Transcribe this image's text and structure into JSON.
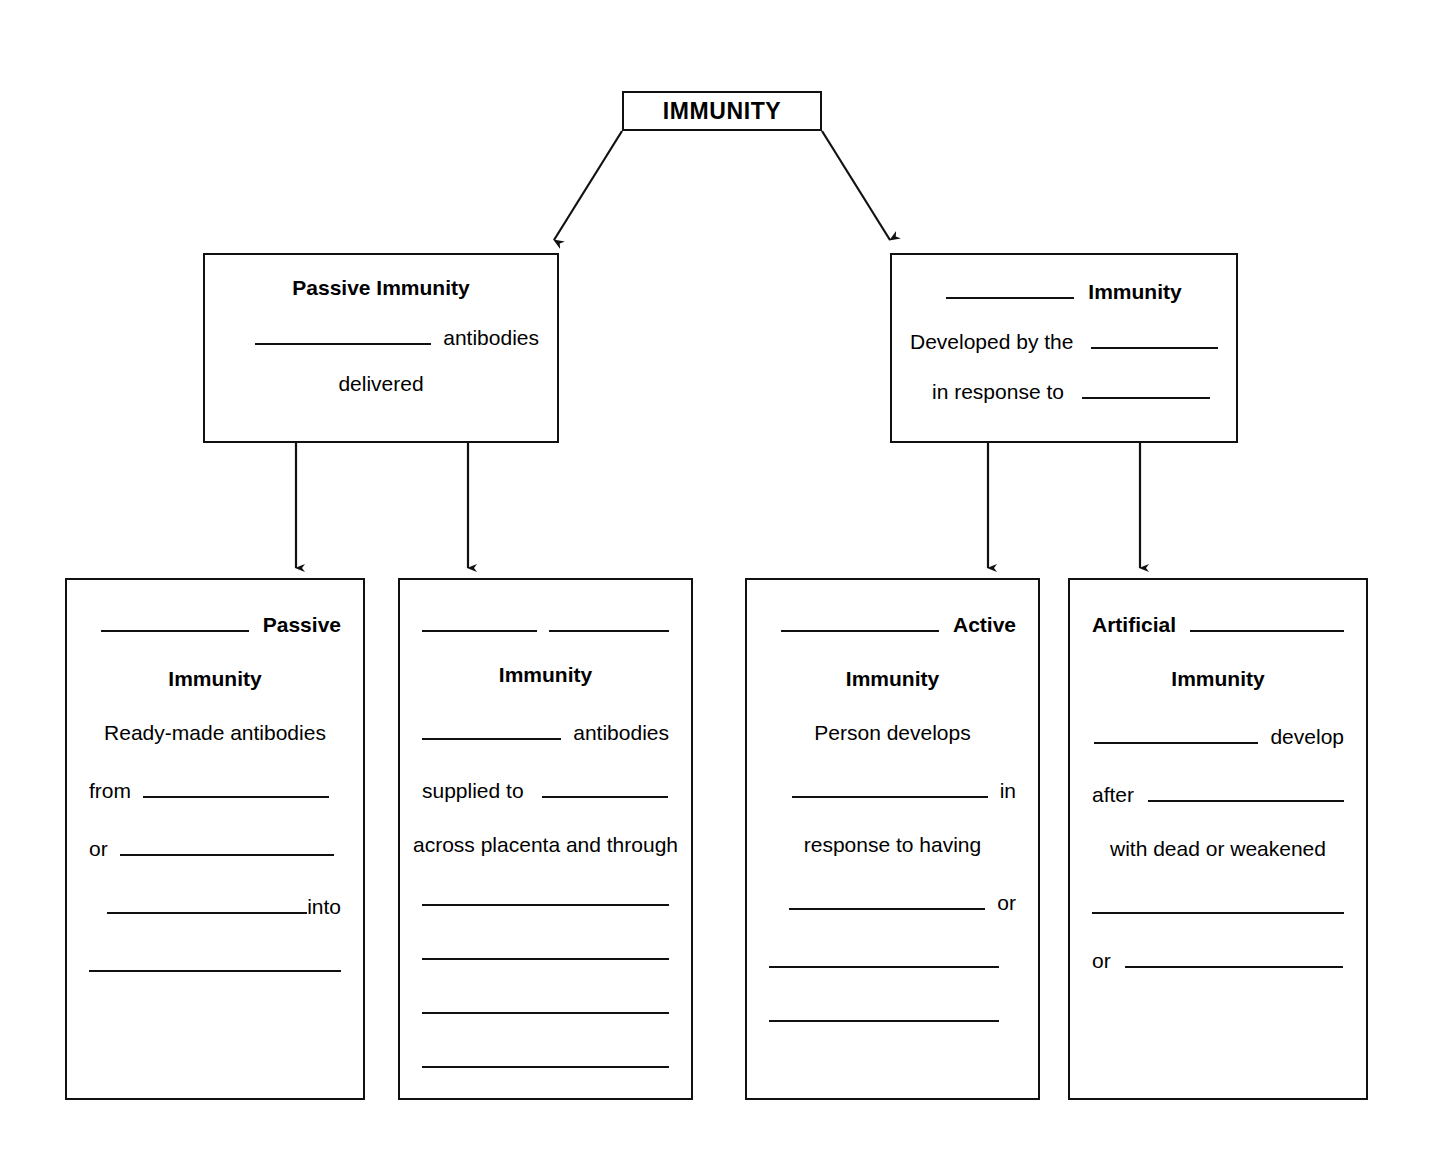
{
  "diagram": {
    "title": "IMMUNITY",
    "root": {
      "label": "IMMUNITY"
    },
    "level2": [
      {
        "id": "passive-immunity",
        "heading_text": "Passive Immunity",
        "heading_blank": false,
        "rows": [
          {
            "blank_before": true,
            "text": "antibodies"
          },
          {
            "blank_before": false,
            "text": "delivered"
          }
        ]
      },
      {
        "id": "blank-immunity",
        "heading_blank_label": "",
        "heading_text": "Immunity",
        "heading_blank": true,
        "rows": [
          {
            "text": "Developed by the",
            "blank_after": true
          },
          {
            "text": "in response to",
            "blank_after": true
          }
        ]
      }
    ],
    "level3": [
      {
        "id": "blank-passive-immunity",
        "title_line1_word": "Passive",
        "title_line2_word": "Immunity",
        "body": [
          "Ready-made antibodies",
          "from",
          "or",
          "into",
          ""
        ]
      },
      {
        "id": "blank-blank-immunity",
        "title_line1_word": "",
        "title_line2_word": "Immunity",
        "body": [
          "antibodies",
          "supplied to",
          "across placenta and through",
          "",
          "",
          "",
          ""
        ]
      },
      {
        "id": "blank-active-immunity",
        "title_line1_word": "Active",
        "title_line2_word": "Immunity",
        "body": [
          "Person develops",
          "in",
          "response to having",
          "or",
          "",
          ""
        ]
      },
      {
        "id": "artificial-blank-immunity",
        "title_line1_word": "Artificial",
        "title_line2_word": "Immunity",
        "body": [
          "develop",
          "after",
          "with dead or weakened",
          "",
          "or"
        ]
      }
    ]
  },
  "boxes": {
    "root_label": "IMMUNITY",
    "b1": {
      "heading": "Passive Immunity",
      "r1_text": "antibodies",
      "r2_text": "delivered"
    },
    "b2": {
      "heading": "Immunity",
      "r1_text": "Developed by the",
      "r2_text": "in response to"
    },
    "b3": {
      "t1": "Passive",
      "t2": "Immunity",
      "l1": "Ready-made antibodies",
      "l2": "from",
      "l3": "or",
      "l4": "into"
    },
    "b4": {
      "t2": "Immunity",
      "l1": "antibodies",
      "l2": "supplied to",
      "l3": "across placenta and through"
    },
    "b5": {
      "t1": "Active",
      "t2": "Immunity",
      "l1": "Person develops",
      "l2": "in",
      "l3": "response to having",
      "l4": "or"
    },
    "b6": {
      "t1": "Artificial",
      "t2": "Immunity",
      "l1": "develop",
      "l2": "after",
      "l3": "with dead or weakened",
      "l4": "or"
    }
  },
  "colors": {
    "stroke": "#111111",
    "background": "#ffffff",
    "text": "#000000"
  }
}
